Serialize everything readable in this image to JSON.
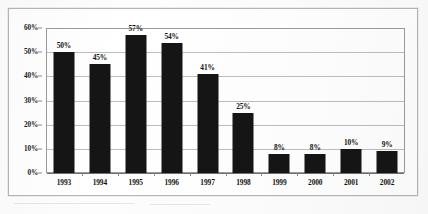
{
  "chart_data": {
    "type": "bar",
    "title": "",
    "subtitle": "",
    "xlabel": "",
    "ylabel": "",
    "categories": [
      "1993",
      "1994",
      "1995",
      "1996",
      "1997",
      "1998",
      "1999",
      "2000",
      "2001",
      "2002"
    ],
    "values": [
      50,
      45,
      57,
      54,
      41,
      25,
      8,
      8,
      10,
      9
    ],
    "value_labels": [
      "50%",
      "45%",
      "57%",
      "54%",
      "41%",
      "25%",
      "8%",
      "8%",
      "10%",
      "9%"
    ],
    "ylim": [
      0,
      60
    ],
    "ytick_values": [
      0,
      10,
      20,
      30,
      40,
      50,
      60
    ],
    "ytick_labels": [
      "0%",
      "10%",
      "20%",
      "30%",
      "40%",
      "50%",
      "60%"
    ],
    "grid": true,
    "legend": false,
    "legend_position": "none",
    "bar_color": "#151515",
    "gridline_color": "#bdbdbd",
    "axis_color": "#9b9b9b",
    "plot_background": "#ffffff",
    "page_background": "#fdfdfd",
    "frame_color": "#b6b6b6"
  }
}
